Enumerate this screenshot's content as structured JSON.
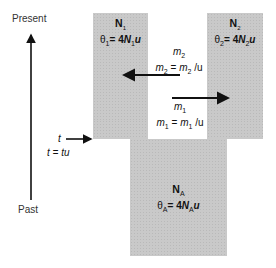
{
  "axis": {
    "top_label": "Present",
    "bottom_label": "Past"
  },
  "populations": {
    "pop1": {
      "name": "N",
      "sub": "1",
      "theta_prefix": "θ",
      "theta_sub": "1",
      "theta_eq": "= 4",
      "theta_N": "N",
      "theta_N_sub": "1",
      "theta_u": "u"
    },
    "pop2": {
      "name": "N",
      "sub": "2",
      "theta_prefix": "θ",
      "theta_sub": "2",
      "theta_eq": "= 4",
      "theta_N": "N",
      "theta_N_sub": "2",
      "theta_u": "u"
    },
    "ancestral": {
      "name": "N",
      "sub": "A",
      "theta_prefix": "θ",
      "theta_sub": "A",
      "theta_eq": "= 4",
      "theta_N": "N",
      "theta_N_sub": "A",
      "theta_u": "u"
    }
  },
  "migration": {
    "m2": {
      "label": "m",
      "label_sub": "2",
      "eq_lhs": "m",
      "eq_lhs_sub": "2",
      "eq_mid": " = ",
      "eq_rhs": "m",
      "eq_rhs_sub": "2",
      "eq_tail": " /u",
      "direction": "pop2 → pop1"
    },
    "m1": {
      "label": "m",
      "label_sub": "1",
      "eq_lhs": "m",
      "eq_lhs_sub": "1",
      "eq_mid": " = ",
      "eq_rhs": "m",
      "eq_rhs_sub": "1",
      "eq_tail": " /u",
      "direction": "pop1 → pop2"
    }
  },
  "split_time": {
    "label": "t",
    "equation": "t = tu"
  },
  "colors": {
    "population_fill": "#c9c9c9",
    "line": "#111111"
  }
}
